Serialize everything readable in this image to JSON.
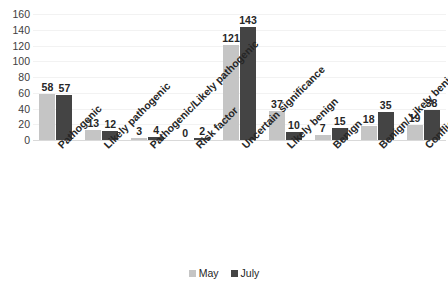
{
  "chart_data": {
    "type": "bar",
    "title": "",
    "subtitle": "",
    "xlabel": "",
    "ylabel": "",
    "ylim": [
      0,
      160
    ],
    "y_ticks": [
      160,
      140,
      120,
      100,
      80,
      60,
      40,
      20,
      0
    ],
    "grid": true,
    "grid_orientation": "horizontal",
    "legend_position": "bottom-center",
    "orientation": "vertical",
    "grouping": "grouped",
    "category_label_rotation": -45,
    "show_data_labels": true,
    "categories": [
      "Pathogenic",
      "Likely pathogenic",
      "Pathogenic/Likely pathogenic",
      "Risk factor",
      "Uncertain significance",
      "Likely benign",
      "Benign",
      "Benign/ Likely benign",
      "Conflicting interpretation"
    ],
    "series": [
      {
        "name": "May",
        "color": "#c5c5c5",
        "values": [
          58,
          13,
          3,
          0,
          121,
          37,
          7,
          18,
          19
        ]
      },
      {
        "name": "July",
        "color": "#444444",
        "values": [
          57,
          12,
          4,
          2,
          143,
          10,
          15,
          35,
          38
        ]
      }
    ]
  },
  "legend": {
    "items": [
      {
        "label": "May",
        "color": "#c5c5c5"
      },
      {
        "label": "July",
        "color": "#444444"
      }
    ]
  },
  "colors": {
    "series_may": "#c5c5c5",
    "series_july": "#444444",
    "gridline": "#f2f2f2",
    "axis_line": "#d9d9d9",
    "text": "#262626",
    "background": "#ffffff"
  }
}
